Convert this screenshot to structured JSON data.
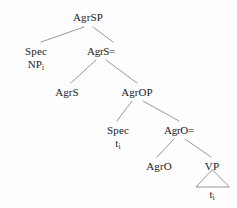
{
  "figure": {
    "type": "syntax-tree",
    "background_color": "#fefefe",
    "line_color": "#8a8a8a",
    "text_color": "#1a1a1a"
  },
  "nodes": {
    "root": {
      "label": "AgrSP",
      "x": 88,
      "y": 11
    },
    "spec_agrsp": {
      "label": "Spec",
      "label2_base": "NP",
      "label2_sub": "i",
      "x": 36,
      "y": 45
    },
    "agrs_bar": {
      "label": "AgrS=",
      "x": 101,
      "y": 45
    },
    "agrs_head": {
      "label": "AgrS",
      "x": 67,
      "y": 86
    },
    "agrop": {
      "label": "AgrOP",
      "x": 137,
      "y": 86
    },
    "spec_agrop": {
      "label": "Spec",
      "label2_base": "t",
      "label2_sub": "i",
      "x": 118,
      "y": 124
    },
    "agro_bar": {
      "label": "AgrO=",
      "x": 179,
      "y": 124
    },
    "agro_head": {
      "label": "AgrO",
      "x": 159,
      "y": 160
    },
    "vp": {
      "label": "VP",
      "x": 212,
      "y": 160
    },
    "trace_vp": {
      "label_base": "t",
      "label_sub": "i",
      "x": 212,
      "y": 190
    }
  },
  "edges": [
    {
      "name": "agrsp-to-spec",
      "x1": 84,
      "y1": 27,
      "x2": 41,
      "y2": 42
    },
    {
      "name": "agrsp-to-agrs-bar",
      "x1": 93,
      "y1": 27,
      "x2": 113,
      "y2": 42
    },
    {
      "name": "agrs-bar-to-agrs-head",
      "x1": 96,
      "y1": 60,
      "x2": 71,
      "y2": 83
    },
    {
      "name": "agrs-bar-to-agrop",
      "x1": 106,
      "y1": 60,
      "x2": 137,
      "y2": 83
    },
    {
      "name": "agrop-to-spec",
      "x1": 132,
      "y1": 101,
      "x2": 117,
      "y2": 121
    },
    {
      "name": "agrop-to-agro-bar",
      "x1": 143,
      "y1": 101,
      "x2": 179,
      "y2": 121
    },
    {
      "name": "agro-bar-to-agro-head",
      "x1": 174,
      "y1": 139,
      "x2": 157,
      "y2": 157
    },
    {
      "name": "agro-bar-to-vp",
      "x1": 185,
      "y1": 139,
      "x2": 211,
      "y2": 157
    }
  ],
  "triangle": {
    "name": "vp-triangle",
    "apex_x": 212,
    "apex_y": 170,
    "left_x": 196,
    "left_y": 187,
    "right_x": 229,
    "right_y": 187
  }
}
